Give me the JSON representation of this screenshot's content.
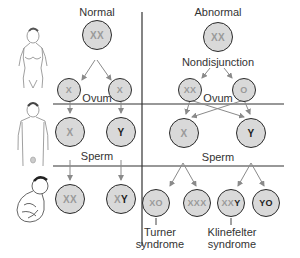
{
  "columns": {
    "normal_title": "Normal",
    "abnormal_title": "Abnormal"
  },
  "labels": {
    "nondisjunction": "Nondisjunction",
    "ovum_left": "Ovum",
    "ovum_right": "Ovum",
    "sperm_left": "Sperm",
    "sperm_right": "Sperm"
  },
  "normal": {
    "mother": "XX",
    "ovum": [
      "X",
      "X"
    ],
    "sperm": [
      {
        "text": "X",
        "dark": ""
      },
      {
        "text": "",
        "dark": "Y"
      }
    ],
    "offspring": [
      {
        "text": "XX",
        "dark": ""
      },
      {
        "text": "X",
        "dark": "Y"
      }
    ]
  },
  "abnormal": {
    "mother": "XX",
    "ovum": [
      "XX",
      "O"
    ],
    "sperm": [
      {
        "text": "X",
        "dark": ""
      },
      {
        "text": "",
        "dark": "Y"
      }
    ],
    "offspring": [
      {
        "text": "XO",
        "dark": ""
      },
      {
        "text": "XXX",
        "dark": ""
      },
      {
        "text": "XX",
        "dark": "Y"
      },
      {
        "text": "",
        "dark": "YO"
      }
    ]
  },
  "syndromes": {
    "turner": [
      "Turner",
      "syndrome"
    ],
    "klinefelter": [
      "Klinefelter",
      "syndrome"
    ]
  },
  "figures": [
    "female-figure",
    "male-figure",
    "fetus-figure"
  ],
  "colors": {
    "cell_fill": "#d9d9d9",
    "cell_border": "#2a2a2a",
    "light_text": "#9a9a9a",
    "dark_text": "#1d1d1d",
    "arrow": "#8a8a8a",
    "divider": "#333333"
  }
}
